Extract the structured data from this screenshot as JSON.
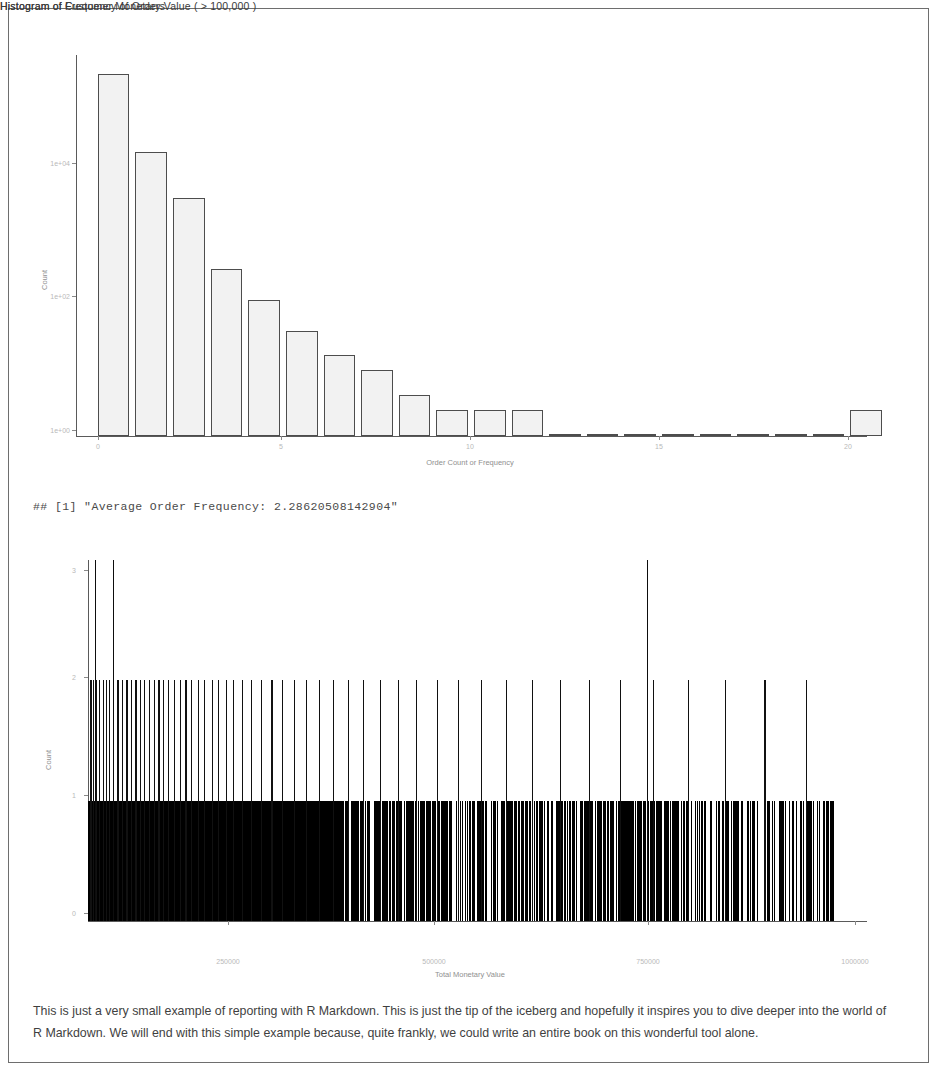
{
  "page": {
    "background": "#ffffff",
    "border_color": "#6e6e6e"
  },
  "figure_frequency": {
    "title": "Histogram of Frequency of Orders"
  },
  "console_output": {
    "text": "## [1] \"Average Order Frequency: 2.28620508142904\"",
    "prefix": "## [1]",
    "label": "Average Order Frequency:",
    "value": "2.28620508142904"
  },
  "figure_monetary": {
    "title": "Histogram of Customer Monetary Value ( > 100,000 )"
  },
  "closing": {
    "paragraph": "This is just a very small example of reporting with R Markdown. This is just the tip of the iceberg and hopefully it inspires you to dive deeper into the world of R Markdown. We will end with this simple example because, quite frankly, we could write an entire book on this wonderful tool alone."
  },
  "chart_data": [
    {
      "id": "frequency_histogram",
      "type": "bar",
      "title": "Histogram of Frequency of Orders",
      "xlabel": "Order Count or Frequency",
      "ylabel": "Count",
      "yscale": "log10",
      "grid": false,
      "legend": null,
      "xlim": [
        0,
        21
      ],
      "ylim": [
        1,
        30000
      ],
      "ytick_values": [
        1,
        100,
        10000
      ],
      "ytick_labels": [
        "1e+00",
        "1e+02",
        "1e+04"
      ],
      "xtick_values": [
        0,
        5,
        10,
        15,
        20
      ],
      "xtick_labels": [
        "0",
        "5",
        "10",
        "15",
        "20"
      ],
      "x": [
        1,
        2,
        3,
        4,
        5,
        6,
        7,
        8,
        9,
        10,
        11,
        12,
        13,
        14,
        15,
        16,
        17,
        18,
        19,
        20,
        21
      ],
      "values": [
        18000,
        2200,
        620,
        92,
        40,
        17,
        9,
        6,
        3,
        2,
        2,
        2,
        1,
        1,
        1,
        1,
        1,
        1,
        1,
        1,
        2
      ],
      "bar_fill": "#f2f2f2",
      "bar_stroke": "#4d4d4d"
    },
    {
      "id": "monetary_histogram",
      "type": "bar",
      "title": "Histogram of Customer Monetary Value ( > 100,000 )",
      "xlabel": "Total Monetary Value",
      "ylabel": "Count",
      "yscale": "linear",
      "grid": false,
      "legend": null,
      "xlim": [
        100000,
        1050000
      ],
      "ylim": [
        0,
        3
      ],
      "ytick_values": [
        0,
        1,
        2,
        3
      ],
      "ytick_labels": [
        "0",
        "1",
        "2",
        "3"
      ],
      "xtick_values": [
        250000,
        500000,
        750000,
        1000000
      ],
      "xtick_labels": [
        "250000",
        "500000",
        "750000",
        "1000000"
      ],
      "bar_fill": "#000000",
      "note": "Dense near-continuous field of unit-count bins; a handful of bins reach count 2 and two bins reach count 3.",
      "bins_count1_density": "near-continuous from 100000 to ~1010000, thinning after ~420000",
      "bins_count2_positions": [
        103000,
        106000,
        110000,
        113000,
        118000,
        122000,
        126000,
        131000,
        136000,
        142000,
        147000,
        153000,
        158000,
        163000,
        168000,
        174000,
        180000,
        186000,
        192000,
        198000,
        205000,
        212000,
        219000,
        226000,
        234000,
        242000,
        251000,
        259000,
        268000,
        277000,
        288000,
        299000,
        311000,
        324000,
        337000,
        351000,
        366000,
        382000,
        399000,
        417000,
        436000,
        456000,
        478000,
        501000,
        526000,
        552000,
        580000,
        610000,
        642000,
        676000,
        712000,
        750000,
        790000,
        833000,
        878000,
        926000,
        977000
      ],
      "bins_count3_positions": [
        108000,
        131000,
        782000
      ]
    }
  ]
}
